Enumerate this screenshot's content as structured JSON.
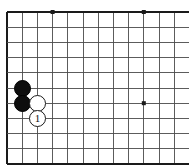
{
  "figure": {
    "kind": "go-board-diagram",
    "background_color": "#ffffff",
    "line_color": "#4a4a4a",
    "edge_color": "#1a1a1a",
    "board": {
      "origin_x": 7,
      "origin_y": 12,
      "spacing": 15.2,
      "columns": 12,
      "rows": 10,
      "edges": {
        "left": true,
        "top": true,
        "right": false,
        "bottom": true
      }
    },
    "star_points": [
      {
        "col": 3,
        "row": 0
      },
      {
        "col": 9,
        "row": 0
      },
      {
        "col": 9,
        "row": 6
      }
    ],
    "star_point_size": 4,
    "stone_diameter": 17,
    "stones": [
      {
        "color": "black",
        "col": 1,
        "row": 5,
        "label": ""
      },
      {
        "color": "black",
        "col": 1,
        "row": 6,
        "label": ""
      },
      {
        "color": "white",
        "col": 2,
        "row": 6,
        "label": ""
      },
      {
        "color": "white",
        "col": 2,
        "row": 7,
        "label": "1"
      }
    ]
  }
}
